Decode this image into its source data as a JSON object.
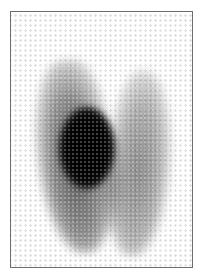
{
  "image": {
    "description": "Grayscale scintigraphy-style scan with two vertical lobes; left lobe contains a dense black hot spot",
    "frame_color": "#6e6e6e",
    "background_color": "#ffffff",
    "regions": [
      {
        "name": "left-lobe",
        "tone": "dark gray"
      },
      {
        "name": "right-lobe",
        "tone": "medium gray"
      },
      {
        "name": "hot-nodule",
        "tone": "black"
      }
    ]
  }
}
